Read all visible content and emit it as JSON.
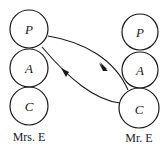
{
  "diagram": {
    "type": "transactional-analysis-crossed-transaction",
    "left": {
      "label": "Mrs. E",
      "states": [
        {
          "letter": "P"
        },
        {
          "letter": "A"
        },
        {
          "letter": "C"
        }
      ]
    },
    "right": {
      "label": "Mr. E",
      "states": [
        {
          "letter": "P"
        },
        {
          "letter": "A"
        },
        {
          "letter": "C"
        }
      ]
    },
    "transactions": [
      {
        "from": "Mrs. E P",
        "to": "Mr. E C",
        "direction": "left-to-right"
      },
      {
        "from": "Mr. E C",
        "to": "Mrs. E P",
        "direction": "right-to-left"
      }
    ]
  }
}
